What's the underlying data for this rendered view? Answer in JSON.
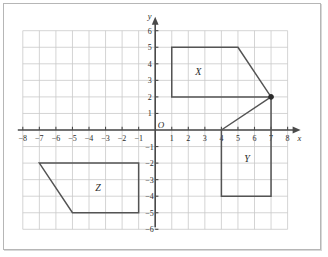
{
  "chart_data": {
    "type": "scatter",
    "title": "",
    "xlabel": "x",
    "ylabel": "y",
    "origin_label": "O",
    "grid": true,
    "xlim": [
      -8,
      8
    ],
    "ylim": [
      -6,
      6
    ],
    "xticks": [
      -8,
      -7,
      -6,
      -5,
      -4,
      -3,
      -2,
      -1,
      1,
      2,
      3,
      4,
      5,
      6,
      7,
      8
    ],
    "yticks": [
      6,
      5,
      4,
      3,
      2,
      1,
      -1,
      -2,
      -3,
      -4,
      -5,
      -6
    ],
    "xtick_labels": [
      "−8",
      "−7",
      "−6",
      "−5",
      "−4",
      "−3",
      "−2",
      "−1",
      "1",
      "2",
      "3",
      "4",
      "5",
      "6",
      "7",
      "8"
    ],
    "ytick_labels": [
      "6",
      "5",
      "4",
      "3",
      "2",
      "1",
      "−1",
      "−2",
      "−3",
      "−4",
      "−5",
      "−6"
    ],
    "shapes": [
      {
        "name": "X",
        "label": "X",
        "label_at": [
          2.6,
          3.55
        ],
        "closed": true,
        "vertices": [
          [
            1,
            5
          ],
          [
            5,
            5
          ],
          [
            7,
            2
          ],
          [
            1,
            2
          ]
        ]
      },
      {
        "name": "Y",
        "label": "Y",
        "label_at": [
          5.55,
          -1.75
        ],
        "closed": true,
        "vertices": [
          [
            4,
            0
          ],
          [
            7,
            2
          ],
          [
            7,
            -4
          ],
          [
            4,
            -4
          ]
        ]
      },
      {
        "name": "Z",
        "label": "Z",
        "label_at": [
          -3.45,
          -3.45
        ],
        "closed": true,
        "vertices": [
          [
            -7,
            -2
          ],
          [
            -1,
            -2
          ],
          [
            -1,
            -5
          ],
          [
            -5,
            -5
          ]
        ]
      }
    ],
    "points": [
      {
        "name": "vertex-marker",
        "at": [
          7,
          2
        ],
        "filled": true
      }
    ],
    "colors": {
      "grid": "#c9c9c9",
      "axis": "#4a4a4a",
      "shape_stroke": "#545454",
      "marker": "#2b2b2b",
      "background": "#ffffff"
    }
  }
}
